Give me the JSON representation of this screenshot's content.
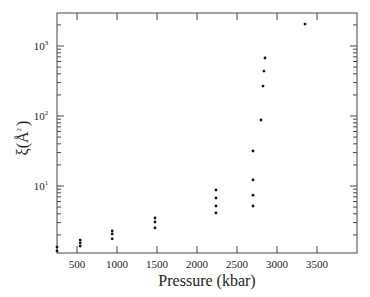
{
  "chart_data": {
    "type": "scatter",
    "title": "",
    "xlabel": "Pressure (kbar)",
    "ylabel": "ξ (Å²)",
    "ylabel_parts": {
      "symbol": "ξ",
      "open": "(",
      "unit": "Å",
      "exp": "2",
      "close": ")"
    },
    "xlim": [
      250,
      4000
    ],
    "ylim": [
      1.1,
      2950
    ],
    "yscale": "log",
    "grid": false,
    "legend": null,
    "x_ticks": [
      500,
      1000,
      1500,
      2000,
      2500,
      3000,
      3500
    ],
    "x_tick_labels": [
      "500",
      "1000",
      "1500",
      "2000",
      "2500",
      "3000",
      "3500"
    ],
    "y_ticks": [
      10,
      100,
      1000
    ],
    "y_tick_labels": [
      {
        "base": "10",
        "exp": "1"
      },
      {
        "base": "10",
        "exp": "2"
      },
      {
        "base": "10",
        "exp": "3"
      }
    ],
    "series": [
      {
        "name": "xi",
        "color": "#111111",
        "points": [
          {
            "x": 250,
            "y": 1.34
          },
          {
            "x": 250,
            "y": 1.18
          },
          {
            "x": 540,
            "y": 1.69
          },
          {
            "x": 540,
            "y": 1.54
          },
          {
            "x": 540,
            "y": 1.39
          },
          {
            "x": 940,
            "y": 2.28
          },
          {
            "x": 940,
            "y": 2.07
          },
          {
            "x": 940,
            "y": 1.76
          },
          {
            "x": 1475,
            "y": 3.49
          },
          {
            "x": 1475,
            "y": 3.06
          },
          {
            "x": 1475,
            "y": 2.52
          },
          {
            "x": 2237,
            "y": 8.77
          },
          {
            "x": 2237,
            "y": 6.74
          },
          {
            "x": 2237,
            "y": 5.18
          },
          {
            "x": 2237,
            "y": 4.12
          },
          {
            "x": 2700,
            "y": 31.6
          },
          {
            "x": 2700,
            "y": 12.2
          },
          {
            "x": 2700,
            "y": 7.4
          },
          {
            "x": 2700,
            "y": 5.18
          },
          {
            "x": 2800,
            "y": 87.7
          },
          {
            "x": 2825,
            "y": 268
          },
          {
            "x": 2837,
            "y": 439
          },
          {
            "x": 2850,
            "y": 674
          },
          {
            "x": 3350,
            "y": 2060
          }
        ]
      }
    ]
  }
}
